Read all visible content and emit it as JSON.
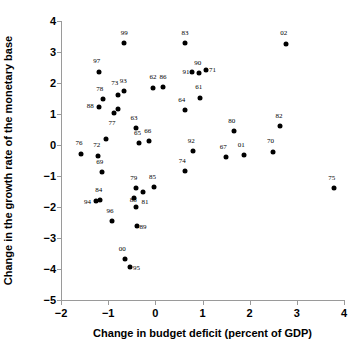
{
  "chart_data": {
    "type": "scatter",
    "title": "",
    "xlabel": "Change in budget deficit (percent of GDP)",
    "ylabel": "Change in the growth rate of the monetary base",
    "xlim": [
      -2,
      4
    ],
    "ylim": [
      -5,
      4
    ],
    "xticks": [
      -2,
      -1,
      0,
      1,
      2,
      3,
      4
    ],
    "xtick_labels": [
      "−2",
      "−1",
      "0",
      "1",
      "2",
      "3",
      "4"
    ],
    "yticks": [
      -5,
      -4,
      -3,
      -2,
      -1,
      0,
      1,
      2,
      3,
      4
    ],
    "ytick_labels": [
      "−5",
      "−4",
      "−3",
      "−2",
      "−1",
      "0",
      "1",
      "2",
      "3",
      "4"
    ],
    "grid": false,
    "legend": null,
    "marker_color": "#000000",
    "axis_color": "#9a9a9a",
    "points": [
      {
        "label": "99",
        "x": -0.66,
        "y": 3.3,
        "lx": -0.66,
        "ly": 3.62
      },
      {
        "label": "83",
        "x": 0.63,
        "y": 3.3,
        "lx": 0.63,
        "ly": 3.62
      },
      {
        "label": "02",
        "x": 2.78,
        "y": 3.27,
        "lx": 2.72,
        "ly": 3.6
      },
      {
        "label": "97",
        "x": -1.2,
        "y": 2.37,
        "lx": -1.24,
        "ly": 2.7
      },
      {
        "label": "91",
        "x": 0.78,
        "y": 2.35,
        "lx": 0.65,
        "ly": 2.35
      },
      {
        "label": "90",
        "x": 0.92,
        "y": 2.33,
        "lx": 0.9,
        "ly": 2.66
      },
      {
        "label": "71",
        "x": 1.08,
        "y": 2.43,
        "lx": 1.21,
        "ly": 2.43
      },
      {
        "label": "62",
        "x": -0.05,
        "y": 1.85,
        "lx": -0.05,
        "ly": 2.18
      },
      {
        "label": "86",
        "x": 0.16,
        "y": 1.87,
        "lx": 0.16,
        "ly": 2.2
      },
      {
        "label": "93",
        "x": -0.66,
        "y": 1.75,
        "lx": -0.68,
        "ly": 2.08
      },
      {
        "label": "73",
        "x": -0.8,
        "y": 1.61,
        "lx": -0.86,
        "ly": 2.0
      },
      {
        "label": "78",
        "x": -1.1,
        "y": 1.47,
        "lx": -1.18,
        "ly": 1.8
      },
      {
        "label": "88",
        "x": -1.2,
        "y": 1.23,
        "lx": -1.38,
        "ly": 1.26
      },
      {
        "label": "61",
        "x": 0.94,
        "y": 1.53,
        "lx": 0.92,
        "ly": 1.86
      },
      {
        "label": "64",
        "x": 0.62,
        "y": 1.13,
        "lx": 0.56,
        "ly": 1.46
      },
      {
        "label": "77",
        "x": -0.88,
        "y": 1.03,
        "lx": -0.92,
        "ly": 0.7
      },
      {
        "label": "77b",
        "x": -0.8,
        "y": 1.16,
        "lx": -10,
        "ly": -10
      },
      {
        "label": "63",
        "x": -0.42,
        "y": 0.55,
        "lx": -0.45,
        "ly": 0.88
      },
      {
        "label": "80",
        "x": 1.66,
        "y": 0.45,
        "lx": 1.62,
        "ly": 0.78
      },
      {
        "label": "82",
        "x": 2.64,
        "y": 0.62,
        "lx": 2.62,
        "ly": 0.95
      },
      {
        "label": "65",
        "x": -0.34,
        "y": 0.07,
        "lx": -0.38,
        "ly": 0.4
      },
      {
        "label": "66",
        "x": -0.14,
        "y": 0.13,
        "lx": -0.16,
        "ly": 0.46
      },
      {
        "label": "69b",
        "x": -1.04,
        "y": 0.18,
        "lx": -10,
        "ly": -10
      },
      {
        "label": "76",
        "x": -1.57,
        "y": -0.28,
        "lx": -1.62,
        "ly": 0.05
      },
      {
        "label": "72",
        "x": -1.22,
        "y": -0.34,
        "lx": -1.24,
        "ly": -0.01
      },
      {
        "label": "92",
        "x": 0.8,
        "y": -0.2,
        "lx": 0.76,
        "ly": 0.13
      },
      {
        "label": "67",
        "x": 1.5,
        "y": -0.39,
        "lx": 1.44,
        "ly": -0.06
      },
      {
        "label": "01",
        "x": 1.87,
        "y": -0.32,
        "lx": 1.82,
        "ly": 0.01
      },
      {
        "label": "70",
        "x": 2.49,
        "y": -0.21,
        "lx": 2.44,
        "ly": 0.12
      },
      {
        "label": "69",
        "x": -1.14,
        "y": -0.87,
        "lx": -1.18,
        "ly": -0.54
      },
      {
        "label": "74",
        "x": 0.63,
        "y": -0.84,
        "lx": 0.57,
        "ly": -0.51
      },
      {
        "label": "79",
        "x": -0.42,
        "y": -1.39,
        "lx": -0.46,
        "ly": -1.06
      },
      {
        "label": "85",
        "x": -0.02,
        "y": -1.37,
        "lx": -0.06,
        "ly": -1.04
      },
      {
        "label": "75",
        "x": 3.78,
        "y": -1.38,
        "lx": 3.74,
        "ly": -1.05
      },
      {
        "label": "81",
        "x": -0.26,
        "y": -1.51,
        "lx": -0.22,
        "ly": -1.85
      },
      {
        "label": "84",
        "x": -1.18,
        "y": -1.76,
        "lx": -1.2,
        "ly": -1.45
      },
      {
        "label": "94",
        "x": -1.26,
        "y": -1.81,
        "lx": -1.44,
        "ly": -1.84
      },
      {
        "label": "88b",
        "x": -0.42,
        "y": -2.01,
        "lx": -10,
        "ly": -10
      },
      {
        "label": "88c",
        "x": -0.45,
        "y": -1.72,
        "lx": -0.47,
        "ly": -1.78
      },
      {
        "label": "96",
        "x": -0.92,
        "y": -2.46,
        "lx": -0.96,
        "ly": -2.13
      },
      {
        "label": "89",
        "x": -0.39,
        "y": -2.6,
        "lx": -0.26,
        "ly": -2.64
      },
      {
        "label": "00",
        "x": -0.65,
        "y": -3.68,
        "lx": -0.7,
        "ly": -3.35
      },
      {
        "label": "95",
        "x": -0.53,
        "y": -3.94,
        "lx": -0.4,
        "ly": -3.98
      }
    ]
  }
}
